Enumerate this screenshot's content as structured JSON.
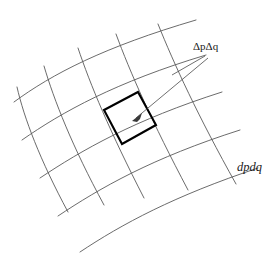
{
  "figure": {
    "background_color": "#ffffff",
    "width": 275,
    "height": 265,
    "labels": {
      "delta_cell": {
        "text": "ΔpΔq",
        "delta_p": "Δp",
        "delta_q": "Δq",
        "delta_symbol": "Δ",
        "p_symbol": "p",
        "q_symbol": "q",
        "x": 193,
        "y": 41,
        "color": "#1a1a1a"
      },
      "differential_area": {
        "text": "dpdq",
        "x": 237,
        "y": 161,
        "color": "#1a1a1a"
      }
    },
    "colors": {
      "grid_stroke": "#5a5a5a",
      "cell_stroke": "#000000",
      "leader_stroke": "#4a4a4a",
      "arrow_fill": "#3a3a3a",
      "text": "#1a1a1a"
    },
    "geometry": {
      "grid_family_a_count": 5,
      "grid_family_b_count": 5,
      "highlighted_cell_corners": [
        [
          138,
          92
        ],
        [
          156,
          125
        ],
        [
          122,
          144
        ],
        [
          104,
          110
        ]
      ],
      "arrow_tip": [
        133,
        120
      ],
      "leader_vertex": [
        172,
        75
      ]
    },
    "curves": {
      "family_a": [
        "M 14 102 C 52 74 104 47 196 20",
        "M 22 140 C 62 112 116 82 206 55",
        "M 40 178 C 82 150 134 120 222 92",
        "M 58 216 C 100 188 152 158 240 130",
        "M 80 252 C 122 224 174 196 258 168"
      ],
      "family_b": [
        "M 17 87 C 24 118 40 160 68 212",
        "M 44 66 C 54 100 72 146 104 205",
        "M 78 48 C 90 84 110 132 144 198",
        "M 116 34 C 130 72 152 122 188 190",
        "M 158 24 C 174 64 198 116 236 184"
      ]
    }
  }
}
